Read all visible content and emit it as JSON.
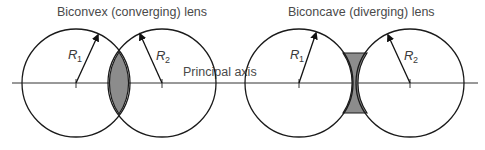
{
  "diagram": {
    "titles": {
      "convex": "Biconvex (converging) lens",
      "concave": "Biconcave (diverging) lens"
    },
    "axis_label": "Principal axis",
    "radius_labels": {
      "r1": {
        "symbol": "R",
        "sub": "1"
      },
      "r2": {
        "symbol": "R",
        "sub": "2"
      }
    },
    "colors": {
      "lens_fill": "#8c8c8c",
      "stroke": "#1a1a1a",
      "text": "#4a4a4a"
    }
  }
}
